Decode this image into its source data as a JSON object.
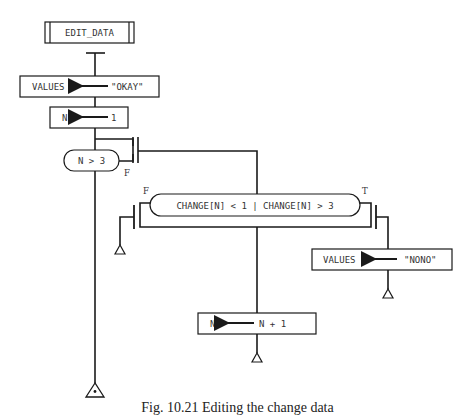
{
  "diagram": {
    "type": "structured-flowchart",
    "module": {
      "label": "EDIT_DATA"
    },
    "assign_values_okay": {
      "target": "VALUES",
      "value": "\"OKAY\""
    },
    "assign_n_init": {
      "target": "N",
      "value": "1"
    },
    "loop_condition": {
      "label": "N > 3",
      "exit_label": "F"
    },
    "decision": {
      "label": "CHANGE[N] < 1 | CHANGE[N] > 3",
      "false_label": "F",
      "true_label": "T"
    },
    "assign_values_nono": {
      "target": "VALUES",
      "value": "\"NONO\""
    },
    "increment_n": {
      "target": "N",
      "value": "N + 1"
    }
  },
  "caption": "Fig. 10.21 Editing the change data"
}
